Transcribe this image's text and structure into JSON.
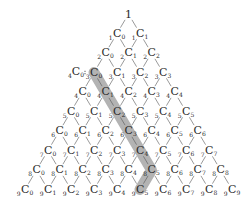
{
  "diagram": {
    "apex_label": "1",
    "rows": 9,
    "symbol": "C",
    "side_label": {
      "n": "4",
      "k": "0",
      "suffix": "="
    },
    "highlight": {
      "color": "#9a9a9a",
      "opacity": 0.75,
      "path_nodes": [
        [
          3,
          0
        ],
        [
          4,
          1
        ],
        [
          5,
          2
        ],
        [
          6,
          3
        ],
        [
          7,
          4
        ],
        [
          8,
          5
        ],
        [
          9,
          5
        ]
      ]
    },
    "line_color": "#555555",
    "text_color": "#2a2a2a"
  }
}
